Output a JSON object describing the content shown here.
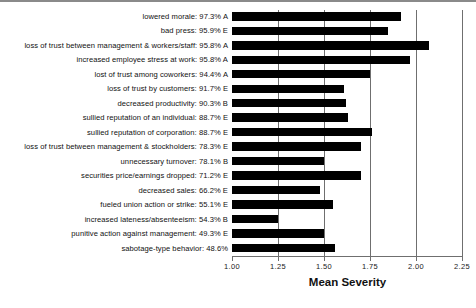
{
  "chart_data": {
    "type": "bar",
    "orientation": "horizontal",
    "title": "",
    "xlabel": "Mean Severity",
    "ylabel": "",
    "xlim": [
      1.0,
      2.25
    ],
    "xticks": [
      "1.00",
      "1.25",
      "1.50",
      "1.75",
      "2.00",
      "2.25"
    ],
    "xtick_values": [
      1.0,
      1.25,
      1.5,
      1.75,
      2.0,
      2.25
    ],
    "grid": true,
    "grid_axis": "x",
    "legend": null,
    "bar_color": "#000000",
    "categories": [
      "lowered morale: 97.3% A",
      "bad press: 95.9% E",
      "loss of trust between management & workers/staff: 95.8% A",
      "increased employee stress at work: 95.8% A",
      "lost of trust among coworkers: 94.4% A",
      "loss of trust by customers: 91.7% E",
      "decreased productivity: 90.3% B",
      "sullied reputation of an individual: 88.7% E",
      "sullied reputation of corporation: 88.7% E",
      "loss of trust between management & stockholders: 78.3% E",
      "unnecessary turnover: 78.1% B",
      "securities price/earnings dropped: 71.2% E",
      "decreased sales: 66.2% E",
      "fueled union action or strike: 55.1% E",
      "increased lateness/absenteeism: 54.3% B",
      "punitive action against management: 49.3% E",
      "sabotage-type behavior: 48.6%"
    ],
    "values": [
      1.92,
      1.85,
      2.07,
      1.97,
      1.75,
      1.61,
      1.62,
      1.63,
      1.76,
      1.7,
      1.5,
      1.7,
      1.48,
      1.55,
      1.25,
      1.5,
      1.56
    ],
    "n_bars": 17
  }
}
